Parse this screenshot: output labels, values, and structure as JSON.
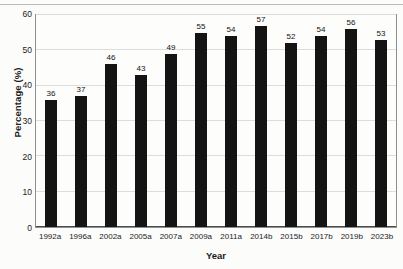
{
  "chart_data": {
    "type": "bar",
    "title": "",
    "xlabel": "Year",
    "ylabel": "Percentage (%)",
    "categories": [
      "1992a",
      "1996a",
      "2002a",
      "2005a",
      "2007a",
      "2009a",
      "2011a",
      "2014b",
      "2015b",
      "2017b",
      "2019b",
      "2023b"
    ],
    "values": [
      36,
      37,
      46,
      43,
      49,
      55,
      54,
      57,
      52,
      54,
      56,
      53
    ],
    "data_labels": [
      "36",
      "37",
      "46",
      "43",
      "49",
      "55",
      "54",
      "57",
      "52",
      "54",
      "56",
      "53"
    ],
    "ylim": [
      0,
      60
    ],
    "ytick_labels": [
      "0",
      "10",
      "20",
      "30",
      "40",
      "50",
      "60"
    ],
    "ytick_values": [
      0,
      10,
      20,
      30,
      40,
      50,
      60
    ],
    "grid": true,
    "grid_axis": "y",
    "legend": false,
    "bar_color": "#141414",
    "plot_border_color": "#8d9091",
    "gridline_color": "#dcdedd",
    "background_color": "#fcfcfb"
  }
}
